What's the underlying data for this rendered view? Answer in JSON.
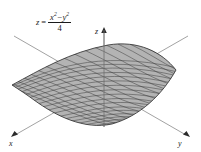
{
  "figure": {
    "background_color": "#ffffff",
    "equation": {
      "lhs": "z",
      "equals": "=",
      "numerator_left": "x",
      "numerator_exp_left": "2",
      "minus": "−",
      "numerator_right": "y",
      "numerator_exp_right": "2",
      "denominator": "4",
      "plain": "z = (x² − y²) / 4"
    },
    "axes": [
      {
        "id": "x",
        "label": "x",
        "position": "bottom-left",
        "arrow": true
      },
      {
        "id": "y",
        "label": "y",
        "position": "bottom-right",
        "arrow": true
      },
      {
        "id": "z",
        "label": "z",
        "position": "top-center",
        "arrow": true
      }
    ],
    "surface": {
      "kind": "saddle",
      "fill_color": "#b4b4b4",
      "mesh_color": "#3c3c3c",
      "outline_color": "#2b2b2b",
      "mesh_u_lines": 17,
      "mesh_v_lines": 17
    },
    "axis_line_color": "#8a8a8a"
  }
}
